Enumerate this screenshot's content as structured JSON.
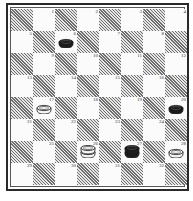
{
  "board": {
    "rows": 8,
    "cols": 8,
    "numbering": [
      [
        null,
        1,
        null,
        2,
        null,
        3,
        null,
        4
      ],
      [
        5,
        null,
        6,
        null,
        7,
        null,
        8,
        null
      ],
      [
        null,
        9,
        null,
        10,
        null,
        11,
        null,
        12
      ],
      [
        13,
        null,
        14,
        null,
        15,
        null,
        16,
        null
      ],
      [
        null,
        17,
        null,
        18,
        null,
        19,
        null,
        20
      ],
      [
        21,
        null,
        22,
        null,
        23,
        null,
        24,
        null
      ],
      [
        null,
        25,
        null,
        26,
        null,
        27,
        null,
        28
      ],
      [
        29,
        null,
        30,
        null,
        31,
        null,
        32,
        null
      ]
    ],
    "pieces": [
      {
        "square": 6,
        "color": "black",
        "type": "man"
      },
      {
        "square": 17,
        "color": "white",
        "type": "man"
      },
      {
        "square": 20,
        "color": "black",
        "type": "man"
      },
      {
        "square": 26,
        "color": "white",
        "type": "king"
      },
      {
        "square": 27,
        "color": "black",
        "type": "king"
      },
      {
        "square": 28,
        "color": "white",
        "type": "man"
      }
    ],
    "colors": {
      "hatch_dark": "#6e6e6e",
      "hatch_light": "#e6e6e6",
      "light_square": "#fbfbfb",
      "black_piece": "#1c1c1c",
      "white_piece": "#f4f4f4",
      "border": "#2a2a2a"
    }
  }
}
